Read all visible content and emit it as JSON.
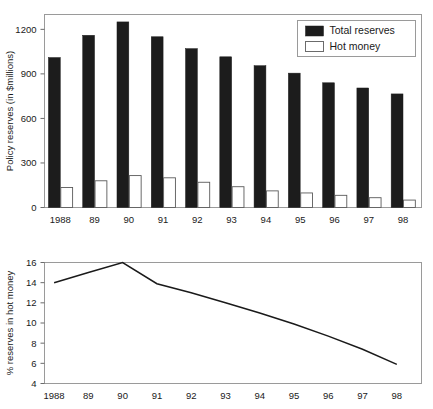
{
  "figure": {
    "background": "#ffffff",
    "panels": [
      "policy-reserves-bar-chart",
      "hot-money-share-line-chart"
    ]
  },
  "chart_data": [
    {
      "type": "bar",
      "id": "policy-reserves",
      "title": "",
      "xlabel": "",
      "ylabel": "Policy reserves (in $millions)",
      "categories": [
        "1988",
        "89",
        "90",
        "91",
        "92",
        "93",
        "94",
        "95",
        "96",
        "97",
        "98"
      ],
      "series": [
        {
          "name": "Total reserves",
          "color": "#1c1c1c",
          "style": "filled",
          "values": [
            1010,
            1160,
            1250,
            1150,
            1070,
            1015,
            955,
            905,
            840,
            805,
            765
          ]
        },
        {
          "name": "Hot money",
          "color": "#ffffff",
          "style": "open",
          "values": [
            135,
            180,
            215,
            200,
            170,
            140,
            112,
            98,
            82,
            66,
            50
          ]
        }
      ],
      "ylim": [
        0,
        1300
      ],
      "yticks": [
        0,
        300,
        600,
        900,
        1200
      ],
      "ytick_labels": [
        "0",
        "300",
        "600",
        "900",
        "1200"
      ],
      "grid": false,
      "legend_position": "top-right",
      "legend_entries": [
        "Total reserves",
        "Hot money"
      ]
    },
    {
      "type": "line",
      "id": "hot-money-share",
      "title": "",
      "xlabel": "",
      "ylabel": "% reserves in hot money",
      "categories": [
        "1988",
        "89",
        "90",
        "91",
        "92",
        "93",
        "94",
        "95",
        "96",
        "97",
        "98"
      ],
      "series": [
        {
          "name": "% reserves in hot money",
          "color": "#1a1a1a",
          "values": [
            14.0,
            15.0,
            16.0,
            13.9,
            13.0,
            12.0,
            11.0,
            9.9,
            8.7,
            7.4,
            5.9
          ]
        }
      ],
      "ylim": [
        4,
        16
      ],
      "yticks": [
        4,
        6,
        8,
        10,
        12,
        14,
        16
      ],
      "ytick_labels": [
        "4",
        "6",
        "8",
        "10",
        "12",
        "14",
        "16"
      ],
      "grid": false,
      "legend_position": "none"
    }
  ]
}
